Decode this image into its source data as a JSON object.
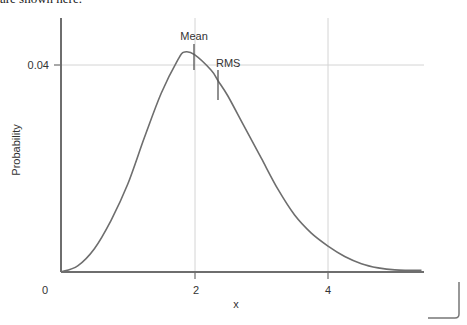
{
  "caption": "are shown here.",
  "chart_data": {
    "type": "line",
    "title": "",
    "xlabel": "x",
    "ylabel": "Probability",
    "xlim": [
      0,
      5.4
    ],
    "ylim": [
      0,
      0.047
    ],
    "x_ticks": [
      "0",
      "2",
      "4"
    ],
    "y_ticks": [
      "0.04"
    ],
    "grid": true,
    "series": [
      {
        "name": "distribution",
        "x": [
          0,
          0.25,
          0.5,
          0.75,
          1.0,
          1.25,
          1.5,
          1.75,
          1.85,
          2.0,
          2.25,
          2.35,
          2.5,
          2.75,
          3.0,
          3.25,
          3.5,
          3.75,
          4.0,
          4.25,
          4.5,
          4.75,
          5.0,
          5.4
        ],
        "y": [
          0,
          0.0012,
          0.0045,
          0.01,
          0.017,
          0.026,
          0.0345,
          0.041,
          0.0425,
          0.042,
          0.039,
          0.037,
          0.034,
          0.028,
          0.022,
          0.016,
          0.011,
          0.0075,
          0.005,
          0.003,
          0.0016,
          0.0008,
          0.0004,
          0.0003
        ]
      }
    ],
    "annotations": [
      {
        "label": "Mean",
        "x": 2.0
      },
      {
        "label": "RMS",
        "x": 2.35
      }
    ]
  },
  "labels": {
    "x0": "0",
    "x2": "2",
    "x4": "4",
    "y004": "0.04",
    "xlabel": "x",
    "ylabel": "Probability",
    "mean": "Mean",
    "rms": "RMS"
  }
}
